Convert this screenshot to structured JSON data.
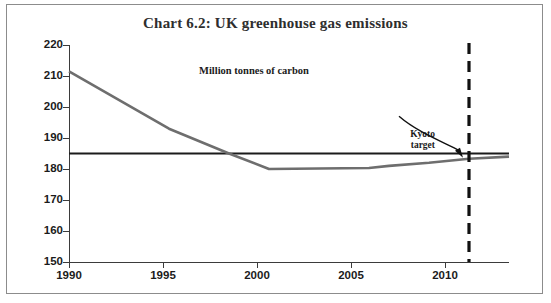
{
  "chart_data": {
    "type": "line",
    "title": "Chart 6.2: UK greenhouse gas emissions",
    "subtitle": "Million tonnes of carbon",
    "xlabel": "",
    "ylabel": "",
    "ylim": [
      150,
      220
    ],
    "xlim": [
      1990,
      2012
    ],
    "yticks": [
      150,
      160,
      170,
      180,
      190,
      200,
      210,
      220
    ],
    "xticks": [
      1990,
      1995,
      2000,
      2005,
      2010
    ],
    "grid": false,
    "legend_position": "none",
    "series": [
      {
        "name": "UK greenhouse gas emissions",
        "x": [
          1990,
          1995,
          1998,
          2000,
          2005,
          2006,
          2008,
          2010,
          2012
        ],
        "values": [
          211.5,
          193.0,
          185.0,
          180.0,
          180.3,
          181.0,
          182.0,
          183.3,
          184.0
        ]
      },
      {
        "name": "Kyoto target level",
        "x": [
          1990,
          2012
        ],
        "values": [
          185.0,
          185.0
        ]
      }
    ],
    "annotations": [
      {
        "name": "kyoto-target",
        "label": "Kyoto\ntarget",
        "label_line1": "Kyoto",
        "label_line2": "target",
        "x": 2010,
        "type": "vertical-dashed-line-with-arrow"
      }
    ],
    "colors": {
      "line": "#6e6e6e",
      "target_line": "#1b1b1b",
      "axis": "#3b3b3b",
      "title": "#2e2e2e",
      "border": "#8c8c8c"
    }
  }
}
